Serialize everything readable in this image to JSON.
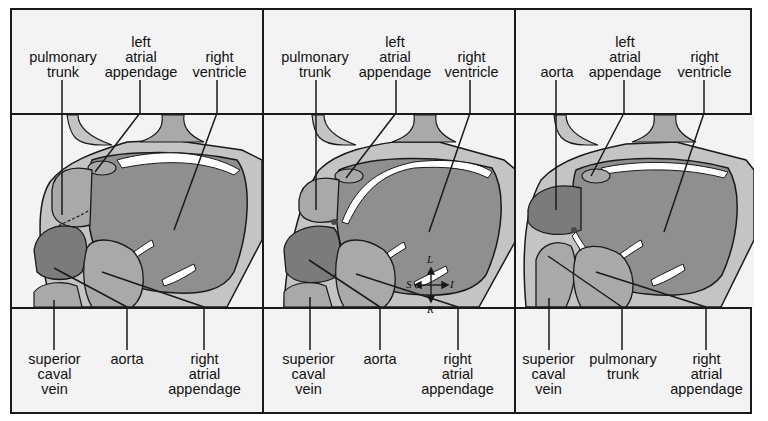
{
  "figure": {
    "colors": {
      "background": "#f3f3f3",
      "light_tissue": "#c4c4c4",
      "ventricle": "#8f8f8f",
      "dark_chamber": "#7b7b7b",
      "mid_tissue": "#a9a9a9",
      "vessel": "#ffffff",
      "outline": "#1a1a1a"
    },
    "panels": [
      {
        "id": "panel-1",
        "top_labels": [
          {
            "text": "pulmonary\ntrunk"
          },
          {
            "text": "left\natrial\nappendage"
          },
          {
            "text": "right\nventricle"
          }
        ],
        "bottom_labels": [
          {
            "text": "superior\ncaval\nvein"
          },
          {
            "text": "aorta"
          },
          {
            "text": "right\natrial\nappendage"
          }
        ]
      },
      {
        "id": "panel-2",
        "top_labels": [
          {
            "text": "pulmonary\ntrunk"
          },
          {
            "text": "left\natrial\nappendage"
          },
          {
            "text": "right\nventricle"
          }
        ],
        "bottom_labels": [
          {
            "text": "superior\ncaval\nvein"
          },
          {
            "text": "aorta"
          },
          {
            "text": "right\natrial\nappendage"
          }
        ],
        "orientation": {
          "up": "L",
          "left": "S",
          "right": "I",
          "down": "R"
        }
      },
      {
        "id": "panel-3",
        "top_labels": [
          {
            "text": "aorta"
          },
          {
            "text": "left\natrial\nappendage"
          },
          {
            "text": "right\nventricle"
          }
        ],
        "bottom_labels": [
          {
            "text": "superior\ncaval\nvein"
          },
          {
            "text": "pulmonary\ntrunk"
          },
          {
            "text": "right\natrial\nappendage"
          }
        ]
      }
    ]
  }
}
